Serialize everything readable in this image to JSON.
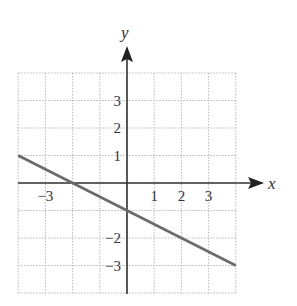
{
  "chart_data": {
    "type": "line",
    "title": "",
    "xlabel": "x",
    "ylabel": "y",
    "xlim": [
      -4,
      4
    ],
    "ylim": [
      -4,
      4
    ],
    "grid": true,
    "x_tick_labels": [
      {
        "value": -3,
        "label": "−3"
      },
      {
        "value": 1,
        "label": "1"
      },
      {
        "value": 2,
        "label": "2"
      },
      {
        "value": 3,
        "label": "3"
      }
    ],
    "y_tick_labels": [
      {
        "value": 3,
        "label": "3"
      },
      {
        "value": 2,
        "label": "2"
      },
      {
        "value": 1,
        "label": "1"
      },
      {
        "value": -2,
        "label": "−2"
      },
      {
        "value": -3,
        "label": "−3"
      }
    ],
    "series": [
      {
        "name": "line",
        "equation": "y = -0.5x - 1",
        "x": [
          -4,
          4
        ],
        "y": [
          1,
          -3
        ],
        "color": "#6b6b6b"
      }
    ]
  }
}
